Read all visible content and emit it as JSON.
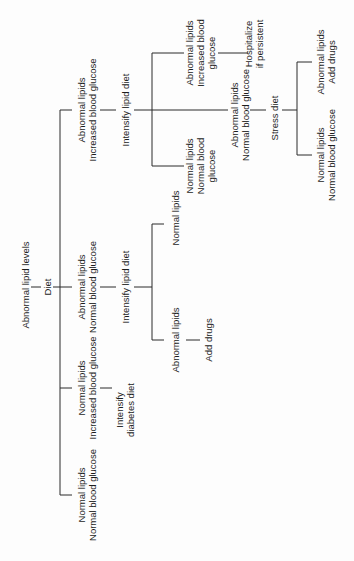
{
  "diagram": {
    "title": "Abnormal lipid levels",
    "line_color": "#2a2a2a",
    "nodes": {
      "root": "Abnormal lipid levels",
      "diet": "Diet",
      "b1": [
        "Abnormal lipids",
        "Increased blood glucose"
      ],
      "b2": [
        "Abnormal lipids",
        "Normal blood glucose"
      ],
      "b3": [
        "Normal lipids",
        "Increased blood glucose"
      ],
      "b4": [
        "Normal lipids",
        "Normal blood glucose"
      ],
      "b1_action": "Intensify lipid diet",
      "b2_action": "Intensify lipid diet",
      "b3_action": [
        "Intensify",
        "diabetes diet"
      ],
      "b2_c1": "Normal lipids",
      "b2_c2": "Abnormal lipids",
      "b2_c2_action": "Add drugs",
      "b1_c1": [
        "Abnormal lipids",
        "Increased blood",
        "glucose"
      ],
      "b1_c1_action": [
        "Hospitalize",
        "if persistent"
      ],
      "b1_c2": [
        "Abnormal lipids",
        "Normal blood glucose"
      ],
      "b1_c2_action": "Stress diet",
      "b1_c3": [
        "Normal lipids",
        "Normal blood",
        "glucose"
      ],
      "b1_c2_r1": [
        "Abnormal lipids",
        "Add drugs"
      ],
      "b1_c2_r2": [
        "Normal lipids",
        "Normal blood glucose"
      ]
    }
  }
}
